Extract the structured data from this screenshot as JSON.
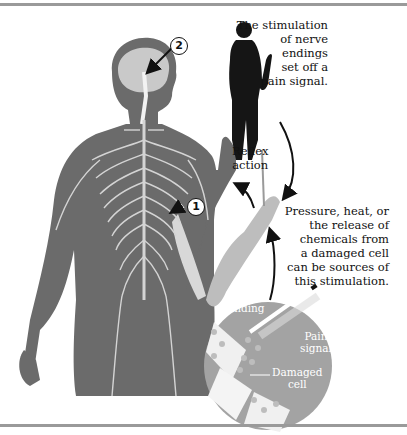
{
  "diagram": {
    "title": "",
    "labels": {
      "stimulation": [
        "The stimulation",
        "of nerve",
        "endings",
        "set off a",
        "pain signal."
      ],
      "reflex": [
        "Reflex",
        "action"
      ],
      "sources": [
        "Pressure, heat, or",
        "the release of",
        "chemicals from",
        "a damaged cell",
        "can be sources of",
        "this stimulation."
      ],
      "inset_nerve_ending": [
        "Nerve",
        "ending"
      ],
      "inset_pain_signal": [
        "Pain",
        "signal"
      ],
      "inset_damaged_cell": [
        "Damaged",
        "cell"
      ]
    },
    "callouts": {
      "one": "1",
      "two": "2"
    },
    "colors": {
      "body": "#6b6b6b",
      "nerves": "#d4d4d4",
      "brain": "#c9c9c9",
      "arm_light": "#bdbdbd",
      "inset_circle": "#a3a3a3",
      "silhouette": "#151515",
      "rule": "#9a9a9a"
    }
  }
}
